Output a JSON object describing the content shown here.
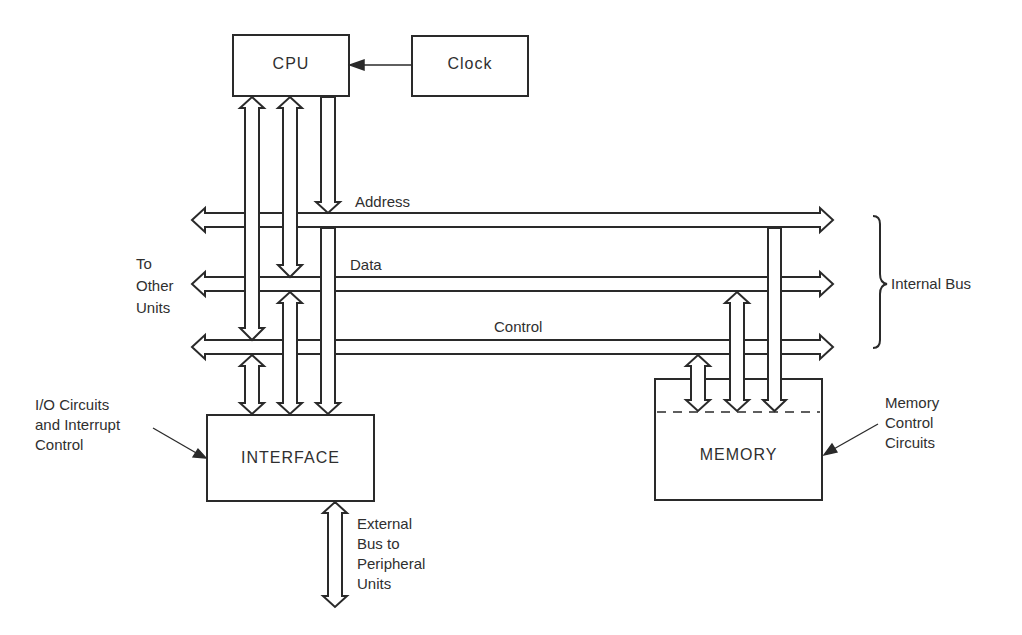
{
  "diagram": {
    "blocks": {
      "cpu": "CPU",
      "clock": "Clock",
      "interface": "INTERFACE",
      "memory": "MEMORY"
    },
    "buses": {
      "address": "Address",
      "data": "Data",
      "control": "Control"
    },
    "annotations": {
      "to_other_units": "To\nOther\nUnits",
      "internal_bus": "Internal Bus",
      "io_circuits": "I/O Circuits\nand Interrupt\nControl",
      "memory_control": "Memory\nControl\nCircuits",
      "external_bus": "External\nBus to\nPeripheral\nUnits"
    },
    "colors": {
      "line": "#2a2a2a",
      "background": "#ffffff"
    }
  }
}
